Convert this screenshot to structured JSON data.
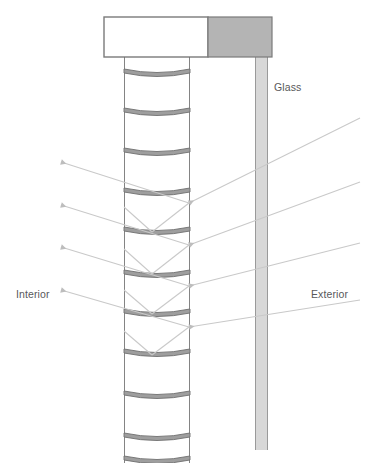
{
  "diagram": {
    "labels": {
      "glass": "Glass",
      "interior": "Interior",
      "exterior": "Exterior"
    },
    "colors": {
      "glass_fill": "#d8d8d8",
      "glass_stroke": "#9a9a9a",
      "headbox_fill": "#b4b4b4",
      "headbox_stroke": "#7a7a7a",
      "slat_fill": "#9e9e9e",
      "slat_stroke": "#6f6f6f",
      "blind_edge": "#6f6f6f",
      "ray_incoming": "#c9c9c9",
      "ray_reflected": "#c9c9c9",
      "label_text": "#58585a",
      "background": "#ffffff"
    },
    "geometry": {
      "width": 367,
      "height": 463,
      "blind_left_x": 124,
      "blind_right_x": 190,
      "blind_top_y": 57,
      "blind_bottom_y": 463,
      "glass_left_x": 255,
      "glass_right_x": 268,
      "glass_top_y": 57,
      "glass_bottom_y": 450,
      "headbox_white": {
        "x": 104,
        "y": 17,
        "w": 104,
        "h": 40
      },
      "headbox_gray": {
        "x": 208,
        "y": 17,
        "w": 64,
        "h": 40
      }
    },
    "slats": {
      "count": 11,
      "curve_sag": 7,
      "thickness": 4,
      "y_positions": [
        73,
        112,
        152,
        192,
        231,
        274,
        313,
        353,
        395,
        437,
        460
      ]
    },
    "rays": {
      "incoming_count": 4,
      "reflected_count": 4,
      "incoming": [
        {
          "x1": 360,
          "y1": 118,
          "x2": 189,
          "y2": 203
        },
        {
          "x1": 360,
          "y1": 182,
          "x2": 189,
          "y2": 245
        },
        {
          "x1": 360,
          "y1": 243,
          "x2": 189,
          "y2": 286
        },
        {
          "x1": 360,
          "y1": 300,
          "x2": 189,
          "y2": 327
        }
      ],
      "reflected": [
        {
          "x1": 189,
          "y1": 203,
          "x2": 61,
          "y2": 162
        },
        {
          "x1": 189,
          "y1": 245,
          "x2": 61,
          "y2": 205
        },
        {
          "x1": 189,
          "y1": 286,
          "x2": 61,
          "y2": 247
        },
        {
          "x1": 189,
          "y1": 327,
          "x2": 61,
          "y2": 290
        }
      ],
      "internal": [
        {
          "x1": 189,
          "y1": 203,
          "x2": 152,
          "y2": 232
        },
        {
          "x1": 152,
          "y1": 232,
          "x2": 124,
          "y2": 207
        },
        {
          "x1": 189,
          "y1": 245,
          "x2": 152,
          "y2": 274
        },
        {
          "x1": 152,
          "y1": 274,
          "x2": 124,
          "y2": 249
        },
        {
          "x1": 189,
          "y1": 286,
          "x2": 152,
          "y2": 314
        },
        {
          "x1": 152,
          "y1": 314,
          "x2": 124,
          "y2": 290
        },
        {
          "x1": 189,
          "y1": 327,
          "x2": 152,
          "y2": 355
        },
        {
          "x1": 152,
          "y1": 355,
          "x2": 124,
          "y2": 331
        }
      ]
    }
  }
}
